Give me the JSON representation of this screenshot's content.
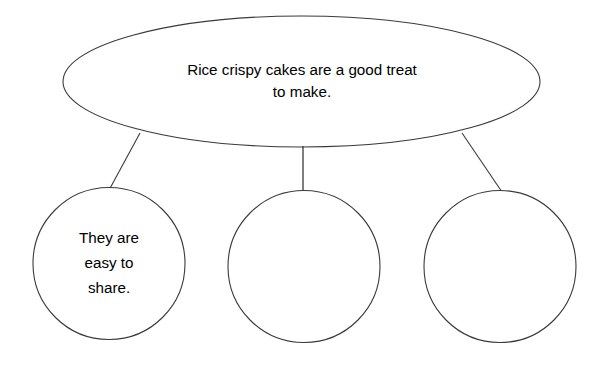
{
  "page": {
    "background_color": "#ffffff",
    "width": 609,
    "height": 365
  },
  "style": {
    "stroke_color": "#3a3a3a",
    "stroke_width": 1,
    "fill_color": "#ffffff",
    "text_color": "#000000"
  },
  "diagram": {
    "type": "web-organiser",
    "main_node": {
      "shape": "ellipse",
      "label": "Rice crispy cakes are a good treat\nto make.",
      "line1": "Rice crispy cakes are a good treat",
      "line2": "to make.",
      "cx": 301.5,
      "cy": 81.5,
      "rx": 238.5,
      "ry": 65.5
    },
    "branch_nodes": [
      {
        "shape": "circle",
        "position": "left",
        "label": "They are\neasy to\nshare.",
        "line1": "They are",
        "line2": "easy to",
        "line3": "share.",
        "cx": 109,
        "cy": 263.5,
        "r": 76
      },
      {
        "shape": "circle",
        "position": "middle",
        "label": "",
        "cx": 304,
        "cy": 266.5,
        "r": 76
      },
      {
        "shape": "circle",
        "position": "right",
        "label": "",
        "cx": 500,
        "cy": 266.5,
        "r": 76
      }
    ],
    "connectors": [
      {
        "name": "connector-left",
        "x1": 140,
        "y1": 133,
        "x2": 108,
        "y2": 192
      },
      {
        "name": "connector-middle",
        "x1": 303,
        "y1": 146,
        "x2": 303,
        "y2": 196
      },
      {
        "name": "connector-right",
        "x1": 462,
        "y1": 133,
        "x2": 502,
        "y2": 192
      }
    ]
  }
}
